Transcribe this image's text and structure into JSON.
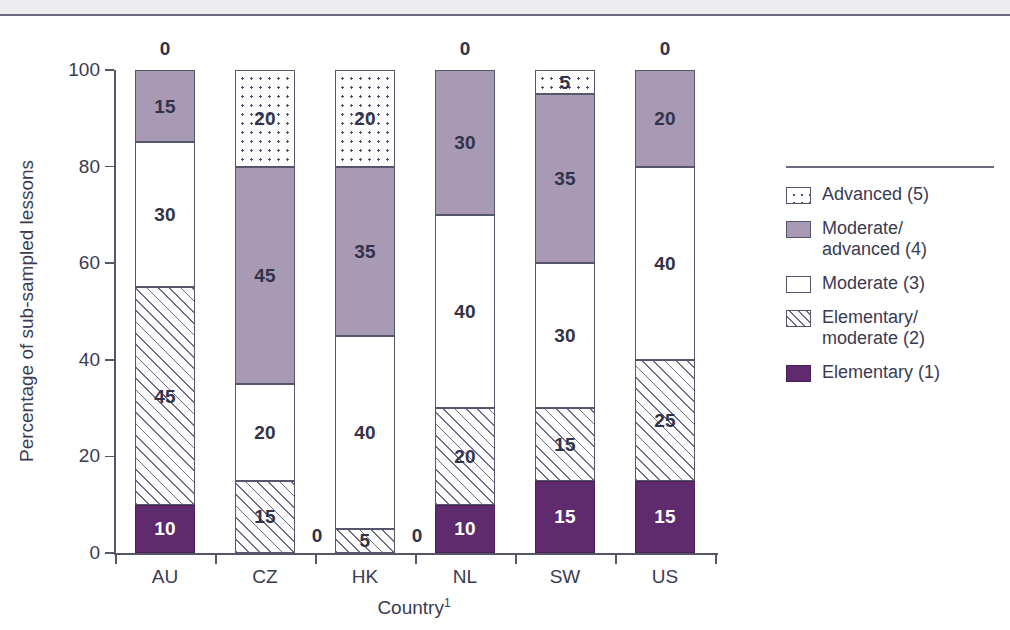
{
  "chart_data": {
    "type": "bar",
    "subtype": "stacked-bar-100",
    "title": "",
    "xlabel": "Country",
    "xlabel_superscript": "1",
    "ylabel": "Percentage of sub-sampled lessons",
    "ylim": [
      0,
      100
    ],
    "yticks": [
      0,
      20,
      40,
      60,
      80,
      100
    ],
    "grid": false,
    "legend_position": "right",
    "categories": [
      "AU",
      "CZ",
      "HK",
      "NL",
      "SW",
      "US"
    ],
    "series": [
      {
        "name": "Advanced (5)",
        "key": "advanced",
        "values": [
          0,
          20,
          20,
          0,
          5,
          0
        ]
      },
      {
        "name": "Moderate/\nadvanced (4)",
        "key": "modadv",
        "values": [
          15,
          45,
          35,
          30,
          35,
          20
        ]
      },
      {
        "name": "Moderate (3)",
        "key": "moderate",
        "values": [
          30,
          20,
          40,
          40,
          30,
          40
        ]
      },
      {
        "name": "Elementary/\nmoderate (2)",
        "key": "elemmod",
        "values": [
          45,
          15,
          5,
          20,
          15,
          25
        ]
      },
      {
        "name": "Elementary (1)",
        "key": "elementary",
        "values": [
          10,
          0,
          0,
          10,
          15,
          15
        ]
      }
    ],
    "zero_labels": {
      "advanced_top": {
        "AU": "0",
        "NL": "0",
        "US": "0"
      },
      "elementary_side": {
        "CZ": "0",
        "HK": "0"
      }
    },
    "colors": {
      "advanced": "#ffffff",
      "modadv": "#a899b5",
      "moderate": "#ffffff",
      "elemmod": "#ffffff",
      "elementary": "#5f2a6e",
      "outline": "#55566b",
      "text": "#3a3b52"
    }
  },
  "axes": {
    "y_title": "Percentage of sub-sampled lessons",
    "x_title": "Country",
    "x_title_sup": "1",
    "y_tick_labels": [
      "100",
      "80",
      "60",
      "40",
      "20",
      "0"
    ],
    "x_tick_labels": [
      "AU",
      "CZ",
      "HK",
      "NL",
      "SW",
      "US"
    ]
  },
  "legend": {
    "items": [
      {
        "label": "Advanced (5)",
        "swatch": "advanced"
      },
      {
        "label": "Moderate/\nadvanced (4)",
        "swatch": "modadv"
      },
      {
        "label": "Moderate (3)",
        "swatch": "moderate"
      },
      {
        "label": "Elementary/\nmoderate (2)",
        "swatch": "elemmod"
      },
      {
        "label": "Elementary (1)",
        "swatch": "elementary"
      }
    ]
  },
  "bar_labels": {
    "AU": {
      "advanced": "0",
      "modadv": "15",
      "moderate": "30",
      "elemmod": "45",
      "elementary": "10"
    },
    "CZ": {
      "advanced": "20",
      "modadv": "45",
      "moderate": "20",
      "elemmod": "15",
      "elementary": "0"
    },
    "HK": {
      "advanced": "20",
      "modadv": "35",
      "moderate": "40",
      "elemmod": "5",
      "elementary": "0"
    },
    "NL": {
      "advanced": "0",
      "modadv": "30",
      "moderate": "40",
      "elemmod": "20",
      "elementary": "10"
    },
    "SW": {
      "advanced": "5",
      "modadv": "35",
      "moderate": "30",
      "elemmod": "15",
      "elementary": "15"
    },
    "US": {
      "advanced": "0",
      "modadv": "20",
      "moderate": "40",
      "elemmod": "25",
      "elementary": "15"
    }
  }
}
